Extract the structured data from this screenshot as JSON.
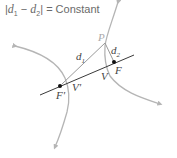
{
  "title": {
    "bar_left": "|",
    "d1": "d",
    "d1_sub": "1",
    "minus": " − ",
    "d2": "d",
    "d2_sub": "2",
    "bar_right": "|",
    "equals": " = Constant"
  },
  "labels": {
    "point": "P",
    "d1": "d",
    "d1_sub": "1",
    "d2": "d",
    "d2_sub": "2",
    "focus": "F",
    "focus_prime": "F'",
    "vertex": "V",
    "vertex_prime": "V'"
  },
  "colors": {
    "curve": "#b5b5b5",
    "line": "#9a9a9a",
    "axis": "#3a3a3a",
    "focus_dot": "#111111"
  }
}
